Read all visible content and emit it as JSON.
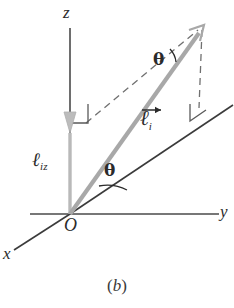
{
  "figure": {
    "caption": "(b)",
    "caption_open_paren": "(",
    "caption_letter": "b",
    "caption_close_paren": ")",
    "type": "vector-decomposition-diagram",
    "colors": {
      "axis": "#4a4a4a",
      "plane_line": "#3b3b3b",
      "dashed": "#6a6a6a",
      "vector_gray": "#a8a8a8",
      "projection_gray": "#b4b4b4",
      "text": "#2b2b2b"
    }
  },
  "axes": {
    "z": {
      "label": "z",
      "x": 70,
      "y_top": 28,
      "y_bottom": 214
    },
    "y": {
      "label": "y",
      "x_start": 30,
      "x_end": 218,
      "y": 214
    },
    "x": {
      "label": "x",
      "from": [
        70,
        214
      ],
      "to": [
        14,
        250
      ]
    },
    "origin": {
      "label": "O",
      "x": 70,
      "y": 214
    }
  },
  "vectors": [
    {
      "name": "l_i",
      "label_base": "ℓ",
      "label_sub": "i",
      "has_overarrow": true,
      "from": [
        70,
        214
      ],
      "to": [
        203,
        27
      ],
      "color": "#a8a8a8",
      "description": "vector l sub i from origin to tip"
    },
    {
      "name": "l_iz",
      "label_base": "ℓ",
      "label_sub": "iz",
      "has_overarrow": false,
      "from": [
        70,
        214
      ],
      "to": [
        70,
        130
      ],
      "color": "#b4b4b4",
      "description": "z-component projection arrow along z axis pointing down to origin side"
    }
  ],
  "angles": [
    {
      "name": "theta-upper",
      "label": "θ",
      "at": [
        160,
        60
      ],
      "between": [
        "dashed-line-from-z-projection",
        "vector-l-i"
      ]
    },
    {
      "name": "theta-lower",
      "label": "θ",
      "at": [
        111,
        171
      ],
      "between": [
        "plane-projection-line",
        "vector-l-i"
      ]
    }
  ],
  "plane_line": {
    "name": "xy-plane-projection-line",
    "from": [
      70,
      214
    ],
    "to": [
      233,
      105
    ]
  },
  "dashed_lines": [
    {
      "name": "dashed-z-to-tip",
      "from": [
        88,
        122
      ],
      "to": [
        199,
        30
      ]
    },
    {
      "name": "dashed-tip-to-plane",
      "from": [
        203,
        30
      ],
      "to": [
        199,
        107
      ]
    }
  ],
  "right_angle_markers": [
    {
      "name": "right-angle-z-axis",
      "at": [
        70,
        123
      ]
    },
    {
      "name": "right-angle-plane",
      "at": [
        200,
        110
      ]
    }
  ]
}
